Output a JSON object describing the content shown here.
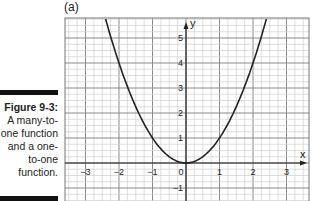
{
  "panel_label": "(a)",
  "caption": {
    "figure": "Figure 9-3:",
    "lines": [
      "A many-to-",
      "one function",
      "and a one-",
      "to-one",
      "function."
    ]
  },
  "chart_data": {
    "type": "line",
    "title": "(a)",
    "function": "y = x^2",
    "xlabel": "x",
    "ylabel": "y",
    "xlim": [
      -3.6,
      3.7
    ],
    "ylim": [
      -1.5,
      5.8
    ],
    "x_ticks": [
      "-3",
      "-2",
      "-1",
      "0",
      "1",
      "2",
      "3"
    ],
    "y_ticks": [
      "5",
      "4",
      "3",
      "2",
      "1",
      "-1"
    ],
    "grid": true,
    "minor_grid_per_unit": 4,
    "series": [
      {
        "name": "parabola",
        "x": [
          -2.4,
          -2,
          -1.5,
          -1,
          -0.5,
          0,
          0.5,
          1,
          1.5,
          2,
          2.4
        ],
        "y": [
          5.76,
          4,
          2.25,
          1,
          0.25,
          0,
          0.25,
          1,
          2.25,
          4,
          5.76
        ]
      }
    ],
    "colors": {
      "curve": "#222222",
      "major_grid": "#8a8a8a",
      "minor_grid": "#d0d0d0",
      "axis": "#222222"
    }
  }
}
